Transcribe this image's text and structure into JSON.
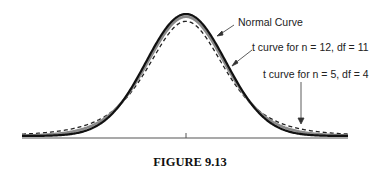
{
  "figure": {
    "caption": "FIGURE 9.13"
  },
  "labels": {
    "normal": "Normal Curve",
    "t11": "t curve for n = 12, df = 11",
    "t4": "t curve for n = 5, df = 4"
  },
  "colors": {
    "normal": "#111111",
    "t11": "#8a8a8a",
    "t4": "#222222",
    "axis": "#555555"
  },
  "chart_data": {
    "type": "line",
    "title": "FIGURE 9.13",
    "xlabel": "",
    "ylabel": "",
    "x_ticks": [
      "0"
    ],
    "grid": false,
    "legend": "annotations with arrows (right side)",
    "series": [
      {
        "name": "Normal Curve",
        "distribution": "standard normal",
        "style": "solid black, thick",
        "relative_peak": 1.0
      },
      {
        "name": "t curve for n = 12, df = 11",
        "distribution": "Student t, df = 11",
        "style": "solid gray, thick",
        "relative_peak": 0.92
      },
      {
        "name": "t curve for n = 5, df = 4",
        "distribution": "Student t, df = 4",
        "style": "dashed black",
        "relative_peak": 0.81
      }
    ],
    "annotations": [
      "Normal Curve",
      "t curve for n = 12, df = 11",
      "t curve for n = 5, df = 4"
    ]
  }
}
